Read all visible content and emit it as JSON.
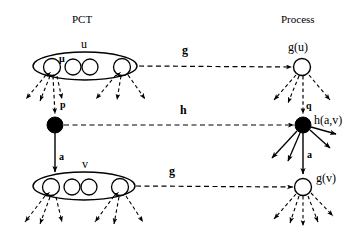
{
  "figure": {
    "columns": {
      "left_header": "PCT",
      "right_header": "Process"
    },
    "nodes": {
      "upper_set_label": "u",
      "upper_member_label": "μ",
      "left_black_node_label": "p",
      "lower_arrow_label": "a",
      "lower_set_label": "v",
      "right_top_label": "g(u)",
      "right_q_label": "q",
      "right_black_label": "h(a,v)",
      "right_a_label": "a",
      "right_bottom_label": "g(v)"
    },
    "edges": {
      "top_map": "g",
      "middle_map": "h",
      "bottom_map": "g"
    },
    "colors": {
      "stroke": "#000000",
      "fill_open": "#ffffff",
      "fill_solid": "#000000",
      "background": "#ffffff"
    },
    "counts": {
      "upper_ellipse_circles": 4,
      "lower_ellipse_circles": 4
    }
  }
}
